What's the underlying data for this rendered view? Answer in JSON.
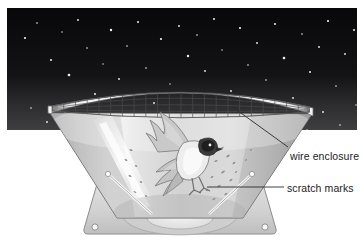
{
  "figure": {
    "type": "scientific-illustration",
    "background_color": "#ffffff",
    "sky": {
      "name": "night-sky-panel",
      "fill_top": "#0a0a0c",
      "fill_bottom": "#3a3a3c",
      "x": 7,
      "y": 8,
      "width": 350,
      "height": 122,
      "star_color": "#f2f2f2",
      "stars": [
        {
          "x": 18,
          "y": 30,
          "r": 1.1
        },
        {
          "x": 30,
          "y": 15,
          "r": 0.8
        },
        {
          "x": 44,
          "y": 52,
          "r": 1.0
        },
        {
          "x": 55,
          "y": 24,
          "r": 0.7
        },
        {
          "x": 62,
          "y": 67,
          "r": 1.3
        },
        {
          "x": 71,
          "y": 12,
          "r": 0.9
        },
        {
          "x": 80,
          "y": 40,
          "r": 0.8
        },
        {
          "x": 88,
          "y": 86,
          "r": 1.0
        },
        {
          "x": 96,
          "y": 56,
          "r": 0.7
        },
        {
          "x": 104,
          "y": 22,
          "r": 1.2
        },
        {
          "x": 112,
          "y": 71,
          "r": 0.9
        },
        {
          "x": 120,
          "y": 38,
          "r": 0.8
        },
        {
          "x": 131,
          "y": 14,
          "r": 1.0
        },
        {
          "x": 139,
          "y": 60,
          "r": 0.8
        },
        {
          "x": 147,
          "y": 95,
          "r": 0.9
        },
        {
          "x": 154,
          "y": 31,
          "r": 1.1
        },
        {
          "x": 163,
          "y": 76,
          "r": 0.7
        },
        {
          "x": 172,
          "y": 18,
          "r": 0.9
        },
        {
          "x": 181,
          "y": 48,
          "r": 1.2
        },
        {
          "x": 190,
          "y": 27,
          "r": 0.8
        },
        {
          "x": 198,
          "y": 63,
          "r": 0.9
        },
        {
          "x": 207,
          "y": 11,
          "r": 1.0
        },
        {
          "x": 215,
          "y": 42,
          "r": 0.7
        },
        {
          "x": 224,
          "y": 83,
          "r": 0.9
        },
        {
          "x": 233,
          "y": 20,
          "r": 1.1
        },
        {
          "x": 241,
          "y": 57,
          "r": 0.8
        },
        {
          "x": 250,
          "y": 35,
          "r": 0.9
        },
        {
          "x": 259,
          "y": 72,
          "r": 0.8
        },
        {
          "x": 268,
          "y": 16,
          "r": 1.0
        },
        {
          "x": 277,
          "y": 50,
          "r": 1.3
        },
        {
          "x": 286,
          "y": 90,
          "r": 0.9
        },
        {
          "x": 295,
          "y": 26,
          "r": 0.8
        },
        {
          "x": 303,
          "y": 64,
          "r": 1.0
        },
        {
          "x": 312,
          "y": 39,
          "r": 0.9
        },
        {
          "x": 321,
          "y": 13,
          "r": 1.1
        },
        {
          "x": 329,
          "y": 78,
          "r": 0.8
        },
        {
          "x": 338,
          "y": 46,
          "r": 0.9
        },
        {
          "x": 347,
          "y": 22,
          "r": 1.0
        },
        {
          "x": 24,
          "y": 100,
          "r": 0.8
        },
        {
          "x": 40,
          "y": 114,
          "r": 0.9
        },
        {
          "x": 58,
          "y": 105,
          "r": 0.7
        },
        {
          "x": 75,
          "y": 120,
          "r": 0.8
        },
        {
          "x": 100,
          "y": 108,
          "r": 0.7
        },
        {
          "x": 126,
          "y": 119,
          "r": 0.8
        },
        {
          "x": 316,
          "y": 104,
          "r": 0.9
        },
        {
          "x": 333,
          "y": 117,
          "r": 0.8
        },
        {
          "x": 349,
          "y": 97,
          "r": 0.7
        },
        {
          "x": 300,
          "y": 122,
          "r": 0.8
        }
      ]
    },
    "funnel": {
      "name": "orientation-funnel",
      "material_color_light": "#f3f3f3",
      "material_color_mid": "#c9c9c9",
      "material_color_dark": "#9a9a9a",
      "outline_color": "#6d6d6d",
      "rim_left_tip": {
        "x": 50,
        "y": 113
      },
      "rim_right_tip": {
        "x": 312,
        "y": 114
      },
      "rim_back_peak": {
        "x": 181,
        "y": 72
      },
      "apex_left": {
        "x": 117,
        "y": 218
      },
      "apex_right": {
        "x": 243,
        "y": 218
      }
    },
    "wire_mesh": {
      "name": "wire-mesh-grid",
      "line_color": "#4a4a4a",
      "columns": 22,
      "rows": 7,
      "ellipse_cx": 181,
      "ellipse_cy": 104,
      "ellipse_rx": 129,
      "ellipse_ry": 13
    },
    "bird": {
      "name": "bird-in-funnel",
      "body_color": "#e8e8e8",
      "wing_color": "#c4c4c4",
      "head_marking_color": "#2a2a2a",
      "position": {
        "x": 184,
        "y": 168
      }
    },
    "scratch_marks": {
      "name": "scratch-mark-speckles",
      "color": "#8a8a8a",
      "description": "faint dark speckles on inner funnel wall"
    },
    "base": {
      "name": "funnel-base-platform",
      "fill": "#d6d6d6",
      "edge": "#8f8f8f",
      "ink_pad_fill": "#ececec",
      "corner_hole_count": 2
    }
  },
  "labels": [
    {
      "id": "wire-enclosure",
      "text": "wire enclosure",
      "x": 290,
      "y": 150,
      "leader": {
        "x1": 288,
        "y1": 148,
        "x2": 234,
        "y2": 108
      }
    },
    {
      "id": "scratch-marks",
      "text": "scratch marks",
      "x": 287,
      "y": 182,
      "leader": {
        "x1": 284,
        "y1": 187,
        "x2": 207,
        "y2": 187
      }
    }
  ]
}
